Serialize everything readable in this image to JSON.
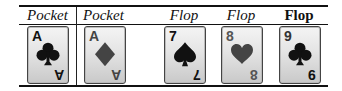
{
  "table": {
    "headers": [
      {
        "label": "Pocket",
        "style": "italic"
      },
      {
        "label": "Pocket",
        "style": "italic"
      },
      {
        "label": "Flop",
        "style": "italic"
      },
      {
        "label": "Flop",
        "style": "italic"
      },
      {
        "label": "Flop",
        "style": "bold"
      }
    ],
    "cards": [
      {
        "rank": "A",
        "suit": "clubs",
        "color": "black"
      },
      {
        "rank": "A",
        "suit": "diamonds",
        "color": "red"
      },
      {
        "rank": "7",
        "suit": "spades",
        "color": "black"
      },
      {
        "rank": "8",
        "suit": "hearts",
        "color": "red"
      },
      {
        "rank": "9",
        "suit": "clubs",
        "color": "black"
      }
    ]
  }
}
